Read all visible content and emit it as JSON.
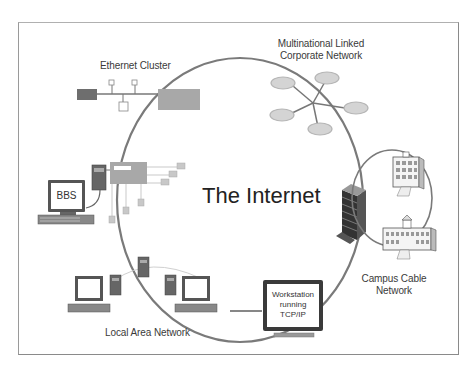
{
  "diagram": {
    "title": "The Internet",
    "nodes": [
      {
        "id": "ethernet",
        "label": "Ethernet Cluster"
      },
      {
        "id": "corporate",
        "label_lines": [
          "Multinational Linked",
          "Corporate Network"
        ]
      },
      {
        "id": "bbs",
        "label": "BBS"
      },
      {
        "id": "campus",
        "label_lines": [
          "Campus Cable",
          "Network"
        ]
      },
      {
        "id": "workstation",
        "label_lines": [
          "Workstation",
          "running",
          "TCP/IP"
        ]
      },
      {
        "id": "lan",
        "label": "Local Area Network"
      }
    ],
    "colors": {
      "ring": "#7a7a7a",
      "hub_box": "#a8a8a8",
      "dark_box": "#6e6e6e",
      "node_fill": "#c4c4c4",
      "ellipse_fill": "#d4d4d4",
      "frame": "#8a8a8a",
      "text": "#3a3a3a"
    }
  }
}
